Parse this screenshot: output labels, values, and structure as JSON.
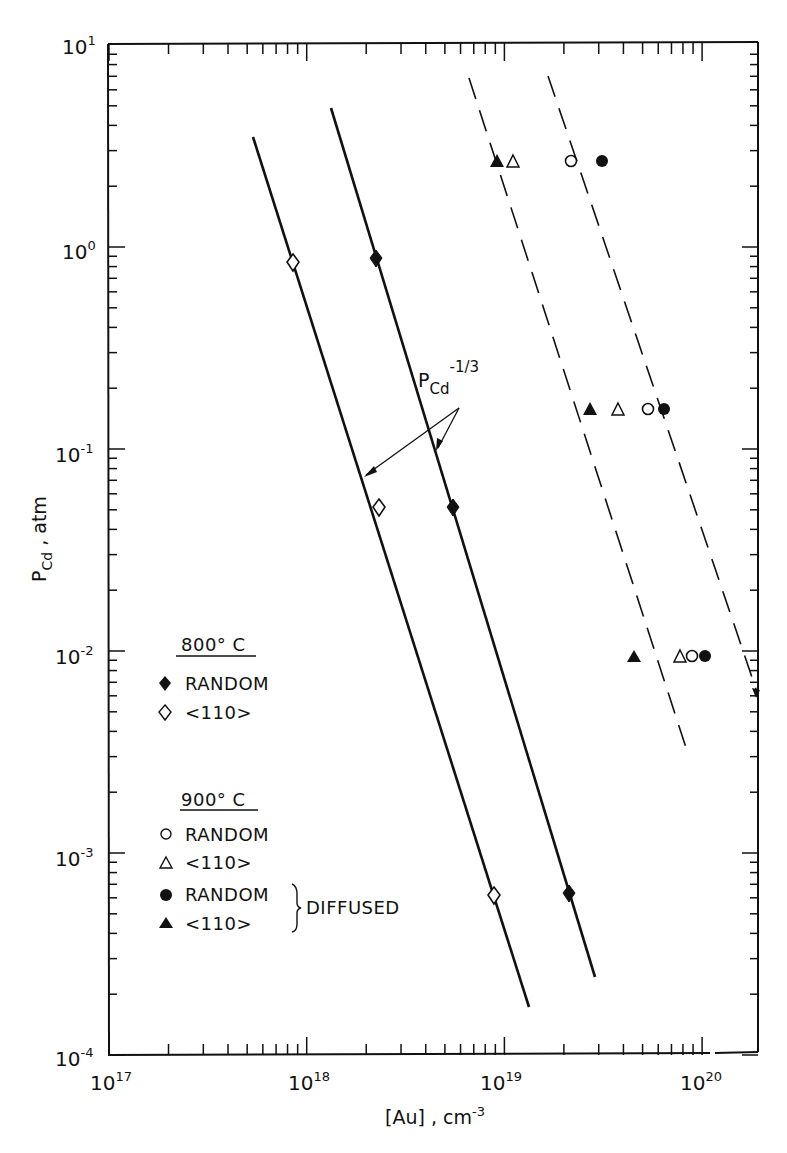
{
  "chart_data": {
    "type": "scatter",
    "title": "",
    "xlabel": "[Au] , cm^-3",
    "ylabel": "P_Cd , atm",
    "xscale": "log",
    "yscale": "log",
    "xlim": [
      1e+17,
      2e+20
    ],
    "ylim": [
      0.0001,
      10
    ],
    "grid": false,
    "x_ticks": [
      "10^17",
      "10^18",
      "10^19",
      "10^20"
    ],
    "y_ticks": [
      "10^-4",
      "10^-3",
      "10^-2",
      "10^-1",
      "10^0",
      "10^1"
    ],
    "annotation": "P_Cd^-1/3",
    "legend_position": "lower-left inside",
    "series": [
      {
        "name": "800°C RANDOM",
        "marker": "filled-diamond",
        "fit_line": "solid",
        "points": [
          [
            2.2e+18,
            0.88
          ],
          [
            5.5e+18,
            0.052
          ],
          [
            2.1e+19,
            0.00063
          ]
        ]
      },
      {
        "name": "800°C <110>",
        "marker": "open-diamond",
        "fit_line": "solid",
        "points": [
          [
            8.5e+17,
            0.84
          ],
          [
            2.3e+18,
            0.052
          ],
          [
            8.9e+18,
            0.00062
          ]
        ]
      },
      {
        "name": "900°C RANDOM",
        "marker": "open-circle",
        "points": [
          [
            2.2e+19,
            2.67
          ],
          [
            5.3e+19,
            0.158
          ],
          [
            8.8e+19,
            0.0095
          ]
        ]
      },
      {
        "name": "900°C <110>",
        "marker": "open-triangle",
        "points": [
          [
            1.1e+19,
            2.67
          ],
          [
            3.7e+19,
            0.158
          ],
          [
            7.7e+19,
            0.0095
          ]
        ]
      },
      {
        "name": "900°C RANDOM DIFFUSED",
        "marker": "filled-circle",
        "fit_line": "dashed",
        "points": [
          [
            3.1e+19,
            2.67
          ],
          [
            6.4e+19,
            0.158
          ],
          [
            1.03e+20,
            0.0095
          ]
        ]
      },
      {
        "name": "900°C <110> DIFFUSED",
        "marker": "filled-triangle",
        "fit_line": "dashed",
        "points": [
          [
            9.1e+18,
            2.67
          ],
          [
            2.7e+19,
            0.158
          ],
          [
            4.5e+19,
            0.0095
          ]
        ]
      }
    ]
  },
  "axes": {
    "x_title_main": "[Au] , cm",
    "x_title_exp": "-3",
    "y_title_main": "P",
    "y_title_sub": "Cd",
    "y_title_rest": " , atm",
    "x_tick_labels": [
      {
        "base": "10",
        "exp": "17"
      },
      {
        "base": "10",
        "exp": "18"
      },
      {
        "base": "10",
        "exp": "19"
      },
      {
        "base": "10",
        "exp": "20"
      }
    ],
    "y_tick_labels": [
      {
        "base": "10",
        "exp": "1"
      },
      {
        "base": "10",
        "exp": "0"
      },
      {
        "base": "10",
        "exp": "-1"
      },
      {
        "base": "10",
        "exp": "-2"
      },
      {
        "base": "10",
        "exp": "-3"
      },
      {
        "base": "10",
        "exp": "-4"
      }
    ]
  },
  "annotation": {
    "main": "P",
    "sub": "Cd",
    "exp": "-1/3"
  },
  "legend": {
    "group1_title": "800° C",
    "group1_items": [
      "RANDOM",
      "<110>"
    ],
    "group2_title": "900° C",
    "group2_items": [
      "RANDOM",
      "<110>",
      "RANDOM",
      "<110>"
    ],
    "diffused_label": "DIFFUSED"
  }
}
